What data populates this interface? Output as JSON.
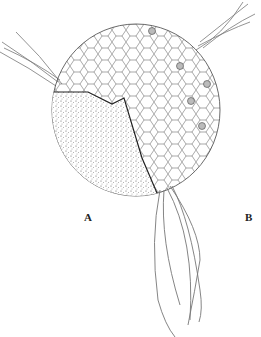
{
  "figure": {
    "panels": [
      {
        "id": "A",
        "label": "A"
      },
      {
        "id": "B",
        "label": "B"
      }
    ],
    "colors": {
      "line": "#333333",
      "background": "#ffffff",
      "flagellum": "#777777"
    }
  }
}
